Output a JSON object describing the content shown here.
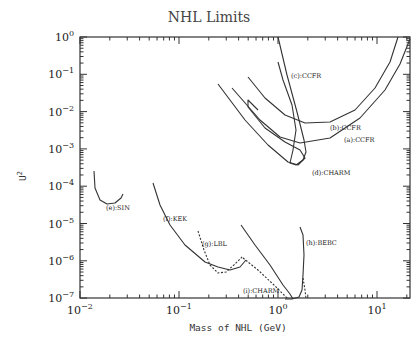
{
  "chart_data": {
    "type": "line",
    "title": "NHL Limits",
    "xlabel": "Mass of NHL (GeV)",
    "ylabel": "U²",
    "xscale": "log",
    "yscale": "log",
    "xlim": [
      0.01,
      21
    ],
    "ylim": [
      1e-07,
      1
    ],
    "x_ticks": [
      "10^-2",
      "10^-1",
      "10^0",
      "10^1"
    ],
    "y_ticks": [
      "10^0",
      "10^-1",
      "10^-2",
      "10^-3",
      "10^-4",
      "10^-5",
      "10^-6",
      "10^-7"
    ],
    "grid": false,
    "legend": "inline labels",
    "series": [
      {
        "name": "(a):CCFR",
        "style": "solid",
        "label_xy": [
          344,
          142
        ],
        "px": [
          [
            232,
            88
          ],
          [
            260,
            120
          ],
          [
            280,
            137
          ],
          [
            300,
            143
          ],
          [
            330,
            138
          ],
          [
            360,
            118
          ],
          [
            385,
            90
          ],
          [
            400,
            64
          ],
          [
            410,
            39
          ]
        ]
      },
      {
        "name": "(b):CCFR",
        "style": "solid",
        "label_xy": [
          330,
          130
        ],
        "px": [
          [
            248,
            77
          ],
          [
            265,
            98
          ],
          [
            285,
            115
          ],
          [
            305,
            123
          ],
          [
            330,
            122
          ],
          [
            355,
            110
          ],
          [
            375,
            88
          ],
          [
            390,
            62
          ],
          [
            398,
            37
          ]
        ]
      },
      {
        "name": "(c):CCFR",
        "style": "solid",
        "label_xy": [
          291,
          78
        ],
        "px": [
          [
            278,
            37
          ],
          [
            287,
            75
          ],
          [
            297,
            112
          ],
          [
            304,
            140
          ],
          [
            306,
            152
          ],
          [
            303,
            160
          ],
          [
            296,
            165
          ],
          [
            290,
            163
          ],
          [
            293,
            150
          ],
          [
            296,
            130
          ],
          [
            292,
            105
          ],
          [
            283,
            80
          ],
          [
            278,
            62
          ]
        ]
      },
      {
        "name": "(d):CHARM",
        "style": "solid",
        "label_xy": [
          312,
          175
        ],
        "px": [
          [
            218,
            84
          ],
          [
            245,
            120
          ],
          [
            268,
            145
          ],
          [
            288,
            162
          ],
          [
            298,
            165
          ],
          [
            305,
            158
          ],
          [
            300,
            150
          ],
          [
            285,
            142
          ],
          [
            265,
            128
          ],
          [
            248,
            107
          ],
          [
            248,
            100
          ],
          [
            258,
            110
          ]
        ]
      },
      {
        "name": "(e):SIN",
        "style": "solid",
        "label_xy": [
          106,
          210
        ],
        "px": [
          [
            94,
            171
          ],
          [
            95,
            188
          ],
          [
            100,
            200
          ],
          [
            107,
            204
          ],
          [
            115,
            203
          ],
          [
            121,
            198
          ],
          [
            123,
            194
          ]
        ]
      },
      {
        "name": "(f):KEK",
        "style": "solid",
        "label_xy": [
          163,
          221
        ],
        "px": [
          [
            153,
            183
          ],
          [
            160,
            205
          ],
          [
            170,
            225
          ],
          [
            185,
            245
          ],
          [
            205,
            262
          ],
          [
            218,
            267
          ],
          [
            230,
            270
          ],
          [
            240,
            267
          ],
          [
            246,
            260
          ]
        ]
      },
      {
        "name": "(g):LBL",
        "style": "dotted",
        "label_xy": [
          202,
          246
        ],
        "px": [
          [
            198,
            231
          ],
          [
            204,
            250
          ],
          [
            210,
            265
          ],
          [
            218,
            273
          ],
          [
            226,
            272
          ],
          [
            235,
            264
          ],
          [
            243,
            256
          ]
        ]
      },
      {
        "name": "(h):BEBC",
        "style": "solid",
        "label_xy": [
          306,
          245
        ],
        "px": [
          [
            300,
            227
          ],
          [
            303,
            235
          ],
          [
            304,
            255
          ],
          [
            303,
            275
          ],
          [
            302,
            290
          ],
          [
            299,
            297
          ],
          [
            292,
            299
          ],
          [
            285,
            299
          ]
        ]
      },
      {
        "name": "(h):BEBC dotted",
        "style": "dotted",
        "label_xy": null,
        "px": [
          [
            303,
            278
          ],
          [
            305,
            290
          ],
          [
            306,
            299
          ]
        ]
      },
      {
        "name": "(i):CHARM",
        "style": "solid",
        "label_xy": [
          243,
          293
        ],
        "px": [
          [
            241,
            225
          ],
          [
            255,
            245
          ],
          [
            270,
            265
          ],
          [
            283,
            285
          ],
          [
            290,
            294
          ],
          [
            293,
            299
          ]
        ]
      },
      {
        "name": "(i):CHARM dotted",
        "style": "dotted",
        "label_xy": null,
        "px": [
          [
            243,
            258
          ],
          [
            258,
            270
          ],
          [
            275,
            286
          ],
          [
            285,
            296
          ],
          [
            288,
            299
          ]
        ]
      }
    ]
  },
  "labels": {
    "title": "NHL Limits",
    "xlabel": "Mass of NHL (GeV)",
    "ylabel_base": "U",
    "ylabel_sup": "2"
  }
}
